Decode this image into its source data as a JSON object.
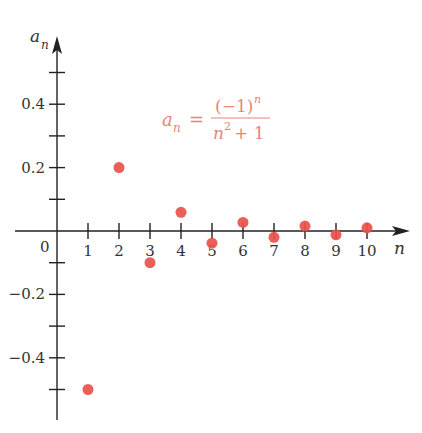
{
  "chart_data": {
    "type": "scatter",
    "title": "",
    "xlabel": "n",
    "ylabel": "a_n",
    "annotation": "a_n = (-1)^n / (n^2 + 1)",
    "x_tick_labels": [
      "0",
      "1",
      "2",
      "3",
      "4",
      "5",
      "6",
      "7",
      "8",
      "9",
      "10"
    ],
    "y_tick_labels": [
      "0.4",
      "0.2",
      "-0.2",
      "-0.4"
    ],
    "xlim": [
      -1,
      11
    ],
    "ylim": [
      -0.6,
      0.6
    ],
    "grid": false,
    "legend": null,
    "point_color": "#e8524a",
    "series": [
      {
        "name": "a_n",
        "x": [
          1,
          2,
          3,
          4,
          5,
          6,
          7,
          8,
          9,
          10
        ],
        "values": [
          -0.5,
          0.2,
          -0.1,
          0.0588,
          -0.0385,
          0.027,
          -0.02,
          0.0154,
          -0.0122,
          0.0099
        ]
      }
    ]
  },
  "labels": {
    "ylabel_main": "a",
    "ylabel_sub": "n",
    "xlabel": "n",
    "origin": "0",
    "formula_lhs_main": "a",
    "formula_lhs_sub": "n",
    "formula_eq": "=",
    "formula_num": "(−1)",
    "formula_num_exp": "n",
    "formula_den_base": "n",
    "formula_den_exp": "2",
    "formula_den_rest": "+ 1"
  }
}
